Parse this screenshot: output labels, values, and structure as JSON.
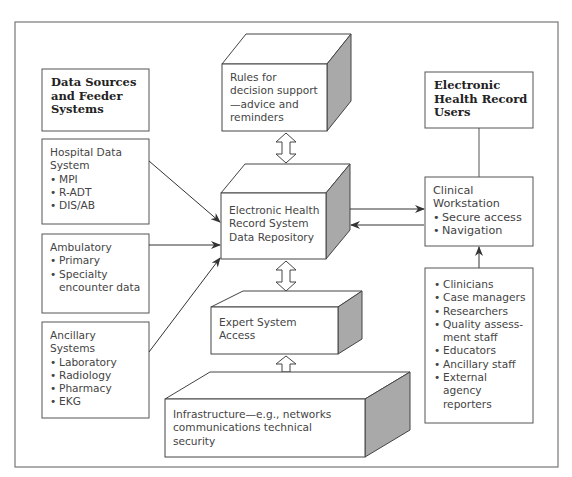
{
  "diagram": {
    "type": "architecture-flow",
    "data_sources": {
      "header": [
        "Data Sources",
        "and Feeder",
        "Systems"
      ],
      "hospital": {
        "title": [
          "Hospital Data",
          "System"
        ],
        "items": [
          "MPI",
          "R-ADT",
          "DIS/AB"
        ]
      },
      "ambulatory": {
        "title": [
          "Ambulatory"
        ],
        "items": [
          "Primary",
          "Specialty",
          "encounter data"
        ]
      },
      "ancillary": {
        "title": [
          "Ancillary",
          "Systems"
        ],
        "items": [
          "Laboratory",
          "Radiology",
          "Pharmacy",
          "EKG"
        ]
      }
    },
    "rules": {
      "lines": [
        "Rules for",
        "decision support",
        "—advice and",
        "reminders"
      ]
    },
    "repository": {
      "lines": [
        "Electronic Health",
        "Record System",
        "Data Repository"
      ]
    },
    "expert": {
      "lines": [
        "Expert System",
        "Access"
      ]
    },
    "infrastructure": {
      "lines": [
        "Infrastructure—e.g., networks",
        "communications technical",
        "security"
      ]
    },
    "ehr_users": {
      "header": [
        "Electronic",
        "Health Record",
        "Users"
      ]
    },
    "workstation": {
      "title": [
        "Clinical",
        "Workstation"
      ],
      "items": [
        "Secure access",
        "Navigation"
      ]
    },
    "users_list": {
      "items": [
        "Clinicians",
        "Case managers",
        "Researchers",
        "Quality assess-",
        "Educators",
        "Ancillary staff",
        "External"
      ],
      "continuations": {
        "3": "ment staff",
        "6a": "agency",
        "6b": "reporters"
      }
    },
    "colors": {
      "line": "#4a4a4a",
      "side_face": "#a9a9a9",
      "frame": "#777777"
    }
  }
}
